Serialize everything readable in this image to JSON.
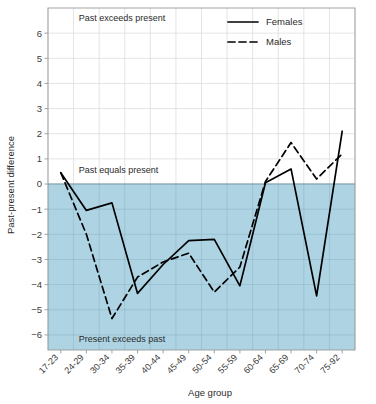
{
  "chart_data": {
    "type": "line",
    "title": "",
    "xlabel": "Age group",
    "ylabel": "Past-present difference",
    "categories": [
      "17-23",
      "24-29",
      "30-34",
      "35-39",
      "40-44",
      "45-49",
      "50-54",
      "55-59",
      "60-64",
      "65-69",
      "70-74",
      "75-92"
    ],
    "series": [
      {
        "name": "Females",
        "style": "solid",
        "values": [
          0.45,
          -1.05,
          -0.75,
          -4.35,
          -3.2,
          -2.25,
          -2.2,
          -4.05,
          0.05,
          0.6,
          -4.45,
          2.1
        ]
      },
      {
        "name": "Males",
        "style": "dashed",
        "values": [
          0.45,
          -2.0,
          -5.35,
          -3.7,
          -3.1,
          -2.75,
          -4.3,
          -3.3,
          0.1,
          1.65,
          0.2,
          1.2
        ]
      }
    ],
    "ylim": [
      -6.6,
      7.0
    ],
    "yticks": [
      -6,
      -5,
      -4,
      -3,
      -2,
      -1,
      0,
      1,
      2,
      3,
      4,
      5,
      6
    ],
    "ytick_labels": [
      "−6",
      "−5",
      "−4",
      "−3",
      "−2",
      "−1",
      "0",
      "1",
      "2",
      "3",
      "4",
      "5",
      "6"
    ],
    "grid": true,
    "legend_position": "top-right",
    "zero_reference_line": 0,
    "shaded_region": {
      "from": -6.6,
      "to": 0,
      "color": "#aed4e4"
    },
    "annotations": [
      {
        "text": "Past exceeds present",
        "x_frac": 0.1,
        "y_value": 6.6
      },
      {
        "text": "Past equals present",
        "x_frac": 0.1,
        "y_value": 0.55
      },
      {
        "text": "Present exceeds past",
        "x_frac": 0.1,
        "y_value": -6.15
      }
    ],
    "colors": {
      "shade": "#aed4e4",
      "line": "#000000",
      "grid_light": "#d9d9d9",
      "grid_shaded": "#7fa9bb",
      "axis": "#9a9a9a",
      "text": "#2b2b2b",
      "background": "#ffffff"
    }
  },
  "legend": {
    "items": [
      {
        "label": "Females",
        "style": "solid"
      },
      {
        "label": "Males",
        "style": "dashed"
      }
    ]
  },
  "axes": {
    "y_title": "Past-present difference",
    "x_title": "Age group"
  }
}
